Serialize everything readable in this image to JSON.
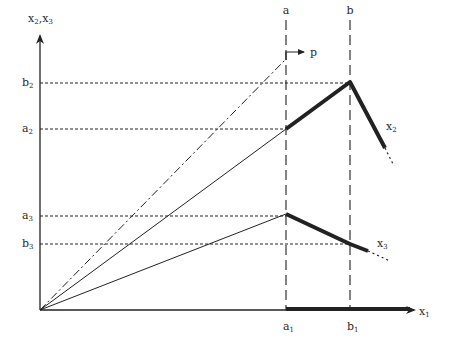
{
  "diagram": {
    "width": 450,
    "height": 347,
    "ink": "#222222",
    "origin": [
      40,
      310
    ],
    "axes": {
      "x_axis": {
        "from": [
          40,
          310
        ],
        "to": [
          414,
          310
        ],
        "label": "x",
        "label_sub": "1",
        "label_pos": [
          419,
          315
        ]
      },
      "y_axis": {
        "from": [
          40,
          310
        ],
        "to": [
          40,
          36
        ],
        "label": "x",
        "label_sub": "2",
        "label2": "x",
        "label2_sub": "3",
        "label_pos": [
          28,
          22
        ]
      }
    },
    "vertical_guides": [
      {
        "name": "a",
        "x": 286,
        "y_top": 20,
        "y_bottom": 310,
        "top_label": "a",
        "bottom_label": "a",
        "bottom_sub": "1"
      },
      {
        "name": "b",
        "x": 350,
        "y_top": 20,
        "y_bottom": 310,
        "top_label": "b",
        "bottom_label": "b",
        "bottom_sub": "1"
      }
    ],
    "horizontal_guides": [
      {
        "name": "b2",
        "y": 83,
        "x_end": 350,
        "label": "b",
        "sub": "2"
      },
      {
        "name": "a2",
        "y": 129,
        "x_end": 286,
        "label": "a",
        "sub": "2"
      },
      {
        "name": "a3",
        "y": 216,
        "x_end": 286,
        "label": "a",
        "sub": "3"
      },
      {
        "name": "b3",
        "y": 244,
        "x_end": 350,
        "label": "b",
        "sub": "3"
      }
    ],
    "p_ray": {
      "from": [
        40,
        310
      ],
      "to": [
        285,
        60
      ],
      "style": "dash-dot"
    },
    "p_arrow": {
      "corner": [
        286,
        52
      ],
      "start_y": 60,
      "tip": [
        304,
        52
      ],
      "label": "p",
      "label_pos": [
        310,
        56
      ]
    },
    "x2_curve": {
      "thin": [
        [
          40,
          310
        ],
        [
          286,
          129
        ]
      ],
      "thick": [
        [
          286,
          129
        ],
        [
          350,
          82
        ],
        [
          385,
          148
        ]
      ],
      "dotted": [
        [
          385,
          148
        ],
        [
          394,
          166
        ]
      ],
      "label": "x",
      "sub": "2",
      "label_pos": [
        386,
        130
      ]
    },
    "x3_curve": {
      "thin": [
        [
          40,
          310
        ],
        [
          286,
          214
        ]
      ],
      "thick": [
        [
          286,
          214
        ],
        [
          350,
          244
        ],
        [
          368,
          251
        ]
      ],
      "dotted": [
        [
          368,
          251
        ],
        [
          390,
          261
        ]
      ],
      "label": "x",
      "sub": "3",
      "label_pos": [
        377,
        247
      ]
    },
    "x1_thick_segment": {
      "from": [
        286,
        310
      ],
      "to": [
        410,
        310
      ]
    }
  }
}
